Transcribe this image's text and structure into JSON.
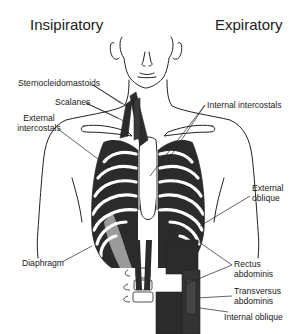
{
  "diagram": {
    "headings": {
      "left": "Insipiratory",
      "right": "Expiratory"
    },
    "labels": {
      "sternocleidomastoids": "Sternocleidomastoids",
      "scalanes": "Scalanes",
      "external_intercostals_line1": "External",
      "external_intercostals_line2": "intercostals",
      "internal_intercostals": "Internal intercostals",
      "external_oblique_line1": "External",
      "external_oblique_line2": "oblique",
      "diaphragm": "Diaphragm",
      "rectus_abdominis_line1": "Rectus",
      "rectus_abdominis_line2": "abdominis",
      "transversus_abdominis_line1": "Transversus",
      "transversus_abdominis_line2": "abdominis",
      "internal_oblique": "Internal oblique"
    },
    "colors": {
      "muscle_dark": "#2b2b2b",
      "muscle_grey": "#9a9a9a",
      "outline": "#222222",
      "background": "#ffffff"
    }
  }
}
